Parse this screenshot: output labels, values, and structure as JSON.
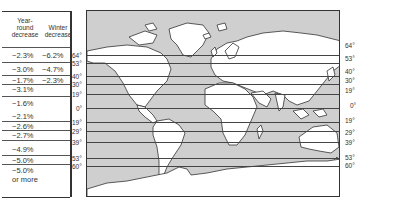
{
  "table": {
    "header_year_round": "Year-\nround\ndecrease",
    "header_winter": "Winter\ndecrease",
    "rows": [
      {
        "year_round": "−2.3%",
        "winter": "−6.2%"
      },
      {
        "year_round": "−3.0%",
        "winter": "−4.7%"
      },
      {
        "year_round": "−1.7%",
        "winter": "−2.3%"
      },
      {
        "year_round": "−3.1%",
        "winter": ""
      },
      {
        "year_round": "−1.6%",
        "winter": ""
      },
      {
        "year_round": "−2.1%",
        "winter": ""
      },
      {
        "year_round": "−2.6%",
        "winter": ""
      },
      {
        "year_round": "−2.7%",
        "winter": ""
      },
      {
        "year_round": "−4.9%",
        "winter": ""
      },
      {
        "year_round": "−5.0%",
        "winter": ""
      },
      {
        "year_round": "−5.0%",
        "winter": "",
        "note": "or more"
      }
    ]
  },
  "latitudes_left": [
    "64°",
    "53°",
    "40°",
    "30°",
    "19°",
    "0°",
    "19°",
    "29°",
    "39°",
    "53°",
    "60°"
  ],
  "latitudes_right": [
    "64°",
    "53°",
    "40°",
    "30°",
    "19°",
    "0°",
    "19°",
    "29°",
    "39°",
    "53°",
    "60°"
  ],
  "colors": {
    "ocean": "#cfcfcf",
    "land": "#ffffff",
    "lines": "#333333"
  }
}
